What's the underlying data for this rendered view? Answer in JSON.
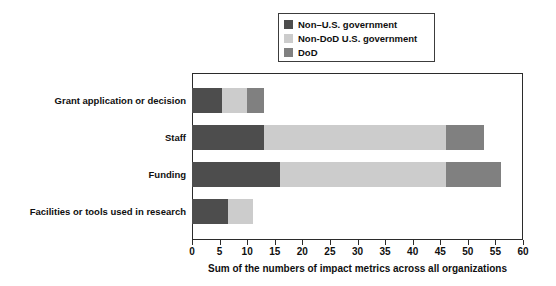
{
  "chart_data": {
    "type": "bar",
    "orientation": "horizontal",
    "stacked": true,
    "title": "",
    "xlabel": "Sum of the numbers of impact metrics across all organizations",
    "ylabel": "",
    "xlim": [
      0,
      60
    ],
    "xticks": [
      0,
      5,
      10,
      15,
      20,
      25,
      30,
      35,
      40,
      45,
      50,
      55,
      60
    ],
    "grid": false,
    "legend_position": "top-center",
    "categories": [
      "Grant application or decision",
      "Staff",
      "Funding",
      "Facilities or tools used in research"
    ],
    "series": [
      {
        "name": "Non–U.S. government",
        "color": "#4d4d4d",
        "values": [
          5.5,
          13,
          16,
          6.5
        ]
      },
      {
        "name": "Non-DoD U.S. government",
        "color": "#cccccc",
        "values": [
          4.5,
          33,
          30,
          4.5
        ]
      },
      {
        "name": "DoD",
        "color": "#808080",
        "values": [
          3,
          7,
          10,
          0
        ]
      }
    ],
    "totals": [
      13,
      53,
      56,
      11
    ]
  },
  "legend": {
    "items": [
      {
        "label": "Non–U.S. government",
        "color": "#4d4d4d"
      },
      {
        "label": "Non-DoD U.S. government",
        "color": "#cccccc"
      },
      {
        "label": "DoD",
        "color": "#808080"
      }
    ]
  },
  "axis": {
    "x_title": "Sum of the numbers of impact metrics across all organizations",
    "x_tick_labels": [
      "0",
      "5",
      "10",
      "15",
      "20",
      "25",
      "30",
      "35",
      "40",
      "45",
      "50",
      "55",
      "60"
    ],
    "y_tick_labels": [
      "Grant application or decision",
      "Staff",
      "Funding",
      "Facilities or tools used in research"
    ]
  },
  "colors": {
    "non_us_government": "#4d4d4d",
    "non_dod_us_government": "#cccccc",
    "dod": "#808080",
    "axis": "#2b2b2b",
    "text": "#0f0f0f",
    "background": "#ffffff"
  }
}
